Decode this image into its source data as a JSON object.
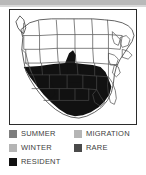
{
  "figure": {
    "kind": "range-map",
    "region": "United States",
    "top_band_color": "#b9b9b9",
    "background_color": "#ffffff"
  },
  "map": {
    "border_color": "#2b2b2b",
    "land_fill": "#ffffff",
    "state_line_color": "#4a4a4a",
    "range": {
      "category": "RESIDENT",
      "fill_color": "#111111",
      "description": "Solid dark range covering the southwestern United States and Texas"
    }
  },
  "legend": {
    "swatch_colors": {
      "summer": "#7d7d7d",
      "winter": "#b5b5b5",
      "resident": "#111111",
      "migration": "#b5b5b5",
      "rare": "#4a4a4a"
    },
    "items": [
      {
        "label": "SUMMER",
        "color": "#7d7d7d",
        "column": "left",
        "row": 0
      },
      {
        "label": "WINTER",
        "color": "#b5b5b5",
        "column": "left",
        "row": 1
      },
      {
        "label": "RESIDENT",
        "color": "#111111",
        "column": "left",
        "row": 2
      },
      {
        "label": "MIGRATION",
        "color": "#b5b5b5",
        "column": "right",
        "row": 0
      },
      {
        "label": "RARE",
        "color": "#4a4a4a",
        "column": "right",
        "row": 1
      }
    ]
  }
}
